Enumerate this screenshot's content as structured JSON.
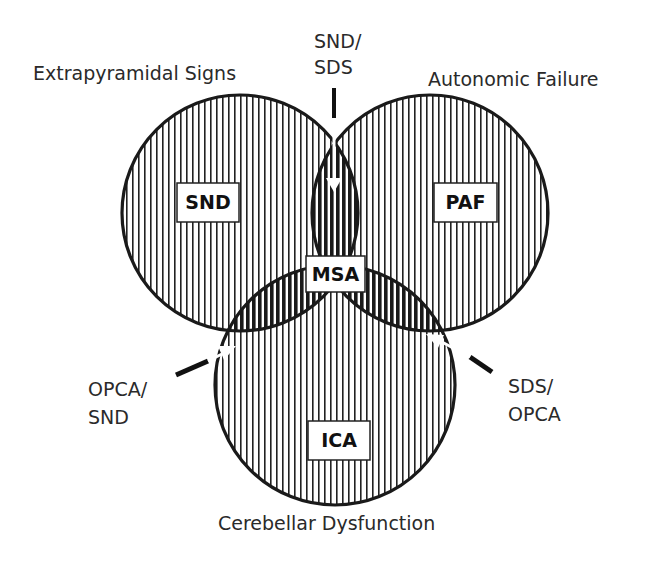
{
  "diagram": {
    "type": "venn",
    "sets": [
      {
        "id": "left",
        "caption": "Extrapyramidal Signs",
        "region_label": "SND"
      },
      {
        "id": "right",
        "caption": "Autonomic Failure",
        "region_label": "PAF"
      },
      {
        "id": "bottom",
        "caption": "Cerebellar Dysfunction",
        "region_label": "ICA"
      }
    ],
    "center_label": "MSA",
    "overlap_labels": {
      "left_right": {
        "line1": "SND/",
        "line2": "SDS"
      },
      "left_bottom": {
        "line1": "OPCA/",
        "line2": "SND"
      },
      "right_bottom": {
        "line1": "SDS/",
        "line2": "OPCA"
      }
    },
    "colors": {
      "outline": "#1a1a1a",
      "hatch": "#222222",
      "background": "#ffffff",
      "label_box": "#ffffff"
    }
  }
}
